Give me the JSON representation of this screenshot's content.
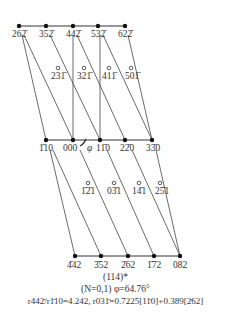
{
  "diagram": {
    "title": "(114)*",
    "rows": {
      "top": [
        {
          "label": "262̄",
          "x": 19,
          "y": 26
        },
        {
          "label": "352̄",
          "x": 46,
          "y": 26
        },
        {
          "label": "442̄",
          "x": 73,
          "y": 26
        },
        {
          "label": "532̄",
          "x": 98,
          "y": 26
        },
        {
          "label": "622̄",
          "x": 125,
          "y": 26
        }
      ],
      "upper_open": [
        {
          "label": "231̄",
          "x": 58,
          "y": 68
        },
        {
          "label": "321̄",
          "x": 84,
          "y": 68
        },
        {
          "label": "411̄",
          "x": 109,
          "y": 68
        },
        {
          "label": "501̄",
          "x": 131,
          "y": 68
        }
      ],
      "middle": [
        {
          "label": "1̄10",
          "x": 46,
          "y": 140
        },
        {
          "label": "000",
          "x": 73,
          "y": 140
        },
        {
          "label": "11̄0",
          "x": 100,
          "y": 140
        },
        {
          "label": "22̄0",
          "x": 125,
          "y": 140
        },
        {
          "label": "33̄0",
          "x": 152,
          "y": 140
        }
      ],
      "lower_open": [
        {
          "label": "1̄2̄1",
          "x": 88,
          "y": 183
        },
        {
          "label": "03̄1",
          "x": 114,
          "y": 183
        },
        {
          "label": "14̄1",
          "x": 139,
          "y": 183
        },
        {
          "label": "25̄1",
          "x": 160,
          "y": 183
        }
      ],
      "bottom": [
        {
          "label": "4̄42",
          "x": 75,
          "y": 256
        },
        {
          "label": "3̄52",
          "x": 101,
          "y": 256
        },
        {
          "label": "2̄62",
          "x": 128,
          "y": 256
        },
        {
          "label": "1̄72",
          "x": 154,
          "y": 256
        },
        {
          "label": "082",
          "x": 180,
          "y": 256
        }
      ]
    },
    "angle_symbol": "φ",
    "caption": {
      "line1": "(114)*",
      "line2": "(N=0,1)  φ=64.76°",
      "line3": "r442̄/r1̄10=4.242, r031̄=0.7225[11̄0]+0.389[2̄62]"
    }
  }
}
